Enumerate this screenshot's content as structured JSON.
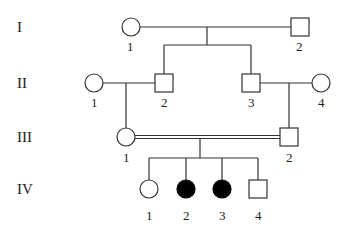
{
  "diagram": {
    "type": "pedigree",
    "generations": [
      {
        "label": "I",
        "y": 27
      },
      {
        "label": "II",
        "y": 83
      },
      {
        "label": "III",
        "y": 137
      },
      {
        "label": "IV",
        "y": 189
      }
    ],
    "individuals": [
      {
        "id": "I-1",
        "label": "1",
        "sex": "female",
        "affected": false,
        "x": 131,
        "y": 27
      },
      {
        "id": "I-2",
        "label": "2",
        "sex": "male",
        "affected": false,
        "x": 300,
        "y": 27
      },
      {
        "id": "II-1",
        "label": "1",
        "sex": "female",
        "affected": false,
        "x": 94,
        "y": 83
      },
      {
        "id": "II-2",
        "label": "2",
        "sex": "male",
        "affected": false,
        "x": 164,
        "y": 83
      },
      {
        "id": "II-3",
        "label": "3",
        "sex": "male",
        "affected": false,
        "x": 251,
        "y": 83
      },
      {
        "id": "II-4",
        "label": "4",
        "sex": "female",
        "affected": false,
        "x": 321,
        "y": 83
      },
      {
        "id": "III-1",
        "label": "1",
        "sex": "female",
        "affected": false,
        "x": 126,
        "y": 137
      },
      {
        "id": "III-2",
        "label": "2",
        "sex": "male",
        "affected": false,
        "x": 289,
        "y": 137
      },
      {
        "id": "IV-1",
        "label": "1",
        "sex": "female",
        "affected": false,
        "x": 149,
        "y": 189
      },
      {
        "id": "IV-2",
        "label": "2",
        "sex": "female",
        "affected": true,
        "x": 186,
        "y": 189
      },
      {
        "id": "IV-3",
        "label": "3",
        "sex": "female",
        "affected": true,
        "x": 222,
        "y": 189
      },
      {
        "id": "IV-4",
        "label": "4",
        "sex": "male",
        "affected": false,
        "x": 258,
        "y": 189
      }
    ],
    "unions": [
      {
        "partners": [
          "I-1",
          "I-2"
        ],
        "consanguineous": false
      },
      {
        "partners": [
          "II-1",
          "II-2"
        ],
        "consanguineous": false
      },
      {
        "partners": [
          "II-3",
          "II-4"
        ],
        "consanguineous": false
      },
      {
        "partners": [
          "III-1",
          "III-2"
        ],
        "consanguineous": true
      }
    ],
    "colors": {
      "line": "#333333",
      "affected": "#000000",
      "unaffected": "#ffffff"
    }
  }
}
